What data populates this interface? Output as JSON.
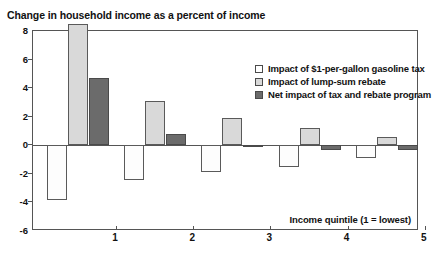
{
  "chart_data": {
    "type": "bar",
    "title": "Change in household income as a percent of income",
    "xlabel": "Income quintile (1 = lowest)",
    "ylabel": "",
    "categories": [
      "1",
      "2",
      "3",
      "4",
      "5"
    ],
    "ylim": [
      -6,
      8
    ],
    "yticks": [
      -6,
      -4,
      -2,
      0,
      2,
      4,
      6,
      8
    ],
    "ytick_labels": [
      "-6",
      "-4",
      "-2",
      "0",
      "2",
      "4",
      "6",
      "8"
    ],
    "grid": false,
    "legend_position": "top-right",
    "series": [
      {
        "name": "Impact of $1-per-gallon gasoline tax",
        "color": "#ffffff",
        "values": [
          -3.8,
          -2.4,
          -1.9,
          -1.5,
          -0.9
        ]
      },
      {
        "name": "Impact of lump-sum rebate",
        "color": "#d9d9d9",
        "values": [
          8.5,
          3.1,
          1.9,
          1.2,
          0.6
        ]
      },
      {
        "name": "Net impact of tax and rebate program",
        "color": "#6b6b6b",
        "values": [
          4.7,
          0.8,
          0.05,
          -0.3,
          -0.3
        ]
      }
    ],
    "annotation": "Income quintile (1 = lowest)"
  },
  "legend": {
    "items": [
      {
        "label": "Impact of $1-per-gallon gasoline tax"
      },
      {
        "label": "Impact of lump-sum rebate"
      },
      {
        "label": "Net impact of tax and rebate program"
      }
    ]
  }
}
